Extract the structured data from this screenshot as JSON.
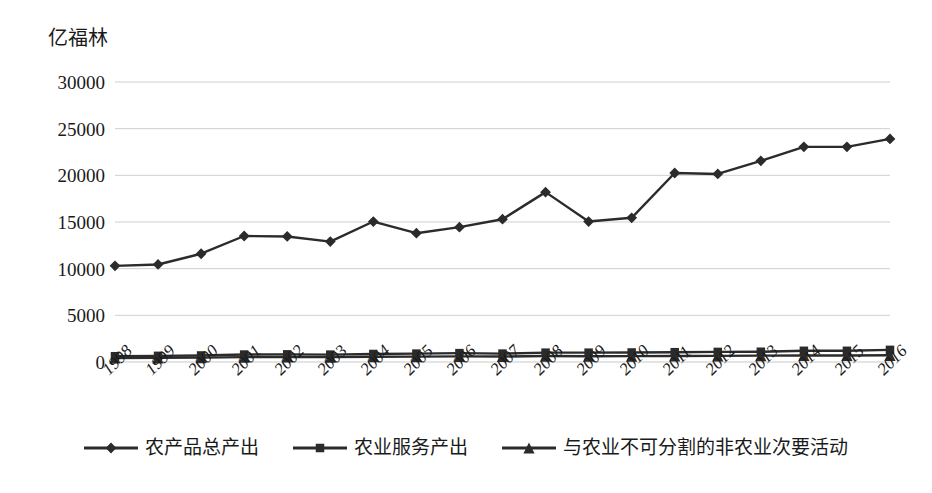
{
  "axis_unit_label": "亿福林",
  "colors": {
    "series": "#2b2b2b",
    "gridline": "#c9c9c9",
    "background": "#ffffff",
    "text": "#1a1a1a"
  },
  "legend": {
    "position": "bottom",
    "items": [
      {
        "label": "农产品总产出",
        "marker": "diamond"
      },
      {
        "label": "农业服务产出",
        "marker": "square"
      },
      {
        "label": "与农业不可分割的非农业次要活动",
        "marker": "triangle"
      }
    ]
  },
  "y_axis": {
    "ticks": [
      "0",
      "5000",
      "10000",
      "15000",
      "20000",
      "25000",
      "30000"
    ]
  },
  "chart_data": {
    "type": "line",
    "title": "",
    "subtitle": "",
    "xlabel": "",
    "ylabel": "亿福林",
    "ylim": [
      0,
      30000
    ],
    "ytick_step": 5000,
    "grid": true,
    "legend_position": "bottom",
    "categories": [
      "1998",
      "1999",
      "2000",
      "2001",
      "2002",
      "2003",
      "2004",
      "2005",
      "2006",
      "2007",
      "2008",
      "2009",
      "2010",
      "2011",
      "2012",
      "2013",
      "2014",
      "2015",
      "2016"
    ],
    "series": [
      {
        "name": "农产品总产出",
        "marker": "diamond",
        "values": [
          10300,
          10450,
          11600,
          13500,
          13450,
          12900,
          15050,
          13800,
          14450,
          15300,
          18200,
          15050,
          15450,
          20250,
          20150,
          21550,
          23050,
          23050,
          23900
        ]
      },
      {
        "name": "农业服务产出",
        "marker": "square",
        "values": [
          620,
          660,
          700,
          800,
          820,
          790,
          860,
          900,
          950,
          900,
          1000,
          1000,
          1020,
          1050,
          1080,
          1100,
          1200,
          1200,
          1300
        ]
      },
      {
        "name": "与农业不可分割的非农业次要活动",
        "marker": "triangle",
        "values": [
          430,
          450,
          470,
          520,
          540,
          520,
          560,
          580,
          600,
          590,
          640,
          620,
          630,
          650,
          660,
          680,
          700,
          700,
          720
        ]
      }
    ]
  }
}
